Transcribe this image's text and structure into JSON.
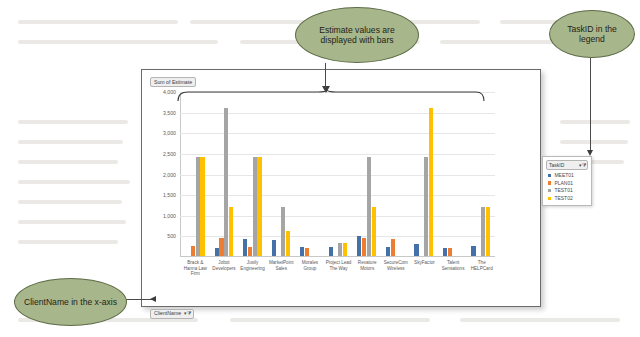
{
  "chart_data": {
    "type": "bar",
    "title": "Sum of Estimate",
    "xlabel": "ClientName",
    "ylabel": "",
    "ylim": [
      0,
      4000
    ],
    "ytick_step": 500,
    "grid": true,
    "legend_position": "right",
    "legend_title": "TaskID",
    "ytick_labels": [
      "4,000",
      "3,500",
      "3,000",
      "2,500",
      "2,000",
      "1,500",
      "1,000",
      "500"
    ],
    "ytick_values": [
      4000,
      3500,
      3000,
      2500,
      2000,
      1500,
      1000,
      500
    ],
    "categories": [
      "Brack & Hanna Law Firm",
      "Jobot Developers",
      "Jusily Engineering",
      "MarketPoint Sales",
      "Morales Group",
      "Project Lead The Way",
      "Revature Motors",
      "SecureCom Wireless",
      "SkyFactor",
      "Talent Sensations",
      "The HELPCard"
    ],
    "series": [
      {
        "name": "MEET01",
        "color": "#4472a8",
        "values": [
          0,
          200,
          420,
          380,
          220,
          220,
          490,
          220,
          300,
          200,
          250
        ]
      },
      {
        "name": "PLAN01",
        "color": "#ed7d31",
        "values": [
          250,
          440,
          220,
          0,
          200,
          0,
          430,
          420,
          0,
          200,
          0
        ]
      },
      {
        "name": "TEST01",
        "color": "#a5a5a5",
        "values": [
          2400,
          3600,
          2400,
          1200,
          0,
          310,
          2400,
          0,
          2400,
          0,
          1200
        ]
      },
      {
        "name": "TEST02",
        "color": "#ffc000",
        "values": [
          2400,
          1200,
          2400,
          600,
          0,
          310,
          1200,
          0,
          3600,
          0,
          1200
        ]
      }
    ]
  },
  "chart": {
    "value_field_label": "Sum of Estimate",
    "category_field_label": "ClientName",
    "legend_field_label": "TaskID",
    "filter_icon": "filter-dropdown-icon",
    "filter_glyph": "▾⧩"
  },
  "callouts": [
    {
      "id": "estimate",
      "text": "Estimate values are displayed with bars"
    },
    {
      "id": "taskid",
      "text": "TaskID in the legend"
    },
    {
      "id": "clientname",
      "text": "ClientName in the x-axis"
    }
  ],
  "colors": {
    "callout_fill": "#a8b68c",
    "callout_border": "#5d6b47",
    "series_1": "#4472a8",
    "series_2": "#ed7d31",
    "series_3": "#a5a5a5",
    "series_4": "#ffc000",
    "gridline": "#e6e6e6"
  }
}
